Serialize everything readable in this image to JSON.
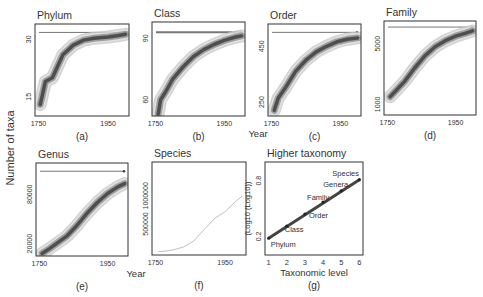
{
  "figure": {
    "shared_ylabel": "Number of taxa",
    "shared_xlabel_top": "Year",
    "shared_xlabel_bottom": "Year"
  },
  "colors": {
    "frame": "#333333",
    "text": "#333333",
    "band_outer": "#c8c8c8",
    "band_mid": "#8a8a8a",
    "band_inner": "#3a3a3a",
    "asymptote": "#777777",
    "species_line": "#c0c0c0",
    "regression": "#444444"
  },
  "chart_data": [
    {
      "id": "a",
      "panel_label": "(a)",
      "title": "Phylum",
      "type": "line",
      "xlabel": "Year",
      "ylabel": "Number of taxa",
      "xticks": [
        "1750",
        "1950"
      ],
      "yticks": [
        "15",
        "30"
      ],
      "xlim": [
        1740,
        2010
      ],
      "ylim": [
        10,
        34
      ],
      "asymptote": 31.8,
      "x": [
        1755,
        1760,
        1770,
        1790,
        1800,
        1820,
        1850,
        1880,
        1910,
        1950,
        1980,
        2000
      ],
      "values": [
        13,
        15,
        19,
        20,
        22,
        26,
        28.5,
        29.8,
        30.3,
        30.6,
        31.0,
        31.3
      ]
    },
    {
      "id": "b",
      "panel_label": "(b)",
      "title": "Class",
      "type": "line",
      "xlabel": "",
      "ylabel": "",
      "xticks": [
        "1750",
        "1950"
      ],
      "yticks": [
        "60",
        "90"
      ],
      "xlim": [
        1740,
        2010
      ],
      "ylim": [
        52,
        98
      ],
      "asymptote": 93,
      "x": [
        1758,
        1765,
        1780,
        1800,
        1830,
        1860,
        1890,
        1920,
        1950,
        1980,
        2000
      ],
      "values": [
        53,
        60,
        64,
        70,
        76,
        81,
        84.5,
        87,
        89,
        90.5,
        91.2
      ]
    },
    {
      "id": "c",
      "panel_label": "(c)",
      "title": "Order",
      "type": "line",
      "xlabel": "",
      "ylabel": "",
      "xticks": [
        "1750",
        "1950"
      ],
      "yticks": [
        "250",
        "450"
      ],
      "xlim": [
        1740,
        2010
      ],
      "ylim": [
        200,
        530
      ],
      "asymptote": 500,
      "x": [
        1758,
        1770,
        1790,
        1820,
        1850,
        1880,
        1910,
        1940,
        1970,
        2000
      ],
      "values": [
        220,
        265,
        300,
        360,
        400,
        430,
        450,
        466,
        475,
        480
      ]
    },
    {
      "id": "d",
      "panel_label": "(d)",
      "title": "Family",
      "type": "line",
      "xlabel": "",
      "ylabel": "",
      "xticks": [
        "1750",
        "1950"
      ],
      "yticks": [
        "1000",
        "5000"
      ],
      "xlim": [
        1740,
        2010
      ],
      "ylim": [
        300,
        6500
      ],
      "asymptote": 6100,
      "x": [
        1758,
        1775,
        1800,
        1830,
        1860,
        1890,
        1920,
        1950,
        1980,
        2000
      ],
      "values": [
        1500,
        1900,
        2500,
        3400,
        4200,
        4800,
        5200,
        5500,
        5700,
        5850
      ]
    },
    {
      "id": "e",
      "panel_label": "(e)",
      "title": "Genus",
      "type": "line",
      "xlabel": "",
      "ylabel": "",
      "xticks": [
        "1750",
        "1950"
      ],
      "yticks": [
        "20000",
        "80000"
      ],
      "xlim": [
        1740,
        2010
      ],
      "ylim": [
        5000,
        118000
      ],
      "asymptote": 108000,
      "x": [
        1758,
        1780,
        1800,
        1830,
        1860,
        1890,
        1920,
        1950,
        1980,
        2000
      ],
      "values": [
        8000,
        14000,
        20000,
        29000,
        42000,
        57000,
        70000,
        81000,
        89000,
        93000
      ]
    },
    {
      "id": "f",
      "panel_label": "(f)",
      "title": "Species",
      "type": "line",
      "xlabel": "",
      "ylabel": "",
      "xticks": [
        "1750",
        "1950"
      ],
      "yticks": [
        "500000",
        "1000000"
      ],
      "xlim": [
        1740,
        2010
      ],
      "ylim": [
        -50000,
        1600000
      ],
      "x": [
        1758,
        1780,
        1800,
        1830,
        1860,
        1890,
        1920,
        1950,
        1980,
        2000
      ],
      "values": [
        10000,
        20000,
        40000,
        90000,
        200000,
        400000,
        600000,
        720000,
        900000,
        1000000
      ]
    },
    {
      "id": "g",
      "panel_label": "(g)",
      "title": "Higher taxonomy",
      "type": "scatter",
      "xlabel": "Taxonomic level",
      "ylabel": "(Log10 (Log10))",
      "xticks": [
        "1",
        "2",
        "3",
        "4",
        "5",
        "6"
      ],
      "yticks": [
        "0.2",
        "0.8"
      ],
      "xlim": [
        0.8,
        6.2
      ],
      "ylim": [
        0.0,
        1.0
      ],
      "points": [
        {
          "label": "Phylum",
          "x": 1,
          "y": 0.18
        },
        {
          "label": "Class",
          "x": 2,
          "y": 0.31
        },
        {
          "label": "Order",
          "x": 3,
          "y": 0.44
        },
        {
          "label": "Family",
          "x": 4,
          "y": 0.57
        },
        {
          "label": "Genera",
          "x": 5,
          "y": 0.69
        },
        {
          "label": "Species",
          "x": 6,
          "y": 0.81
        }
      ]
    }
  ]
}
